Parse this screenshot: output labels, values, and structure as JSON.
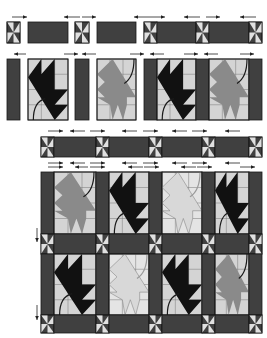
{
  "diagram": {
    "colors": {
      "sashing": "#404040",
      "outline": "#1a1a1a",
      "background": "#d4d4d4",
      "dark_leaf": "#111111",
      "medium_leaf": "#8a8a8a",
      "light_leaf": "#d8d8d8",
      "pinwheel_light": "#e0e0e0",
      "arrow": "#222222"
    },
    "steps": [
      {
        "name": "sashing-row-units",
        "description": "Pinwheel cornerstones and sashing strips, pressed toward sashing"
      },
      {
        "name": "block-row-units",
        "description": "Sashing strips and leaf blocks, pressed toward sashing"
      },
      {
        "name": "joined-sashing-row",
        "description": "Sashing row: 5 cornerstones, 4 sashing strips"
      },
      {
        "name": "assembled-quilt",
        "description": "2 block rows of 4 leaf blocks, joined with sashing rows"
      }
    ],
    "block_row": [
      "dark",
      "medium",
      "light",
      "dark"
    ],
    "block_row_2": [
      "dark",
      "light",
      "dark",
      "medium"
    ]
  }
}
